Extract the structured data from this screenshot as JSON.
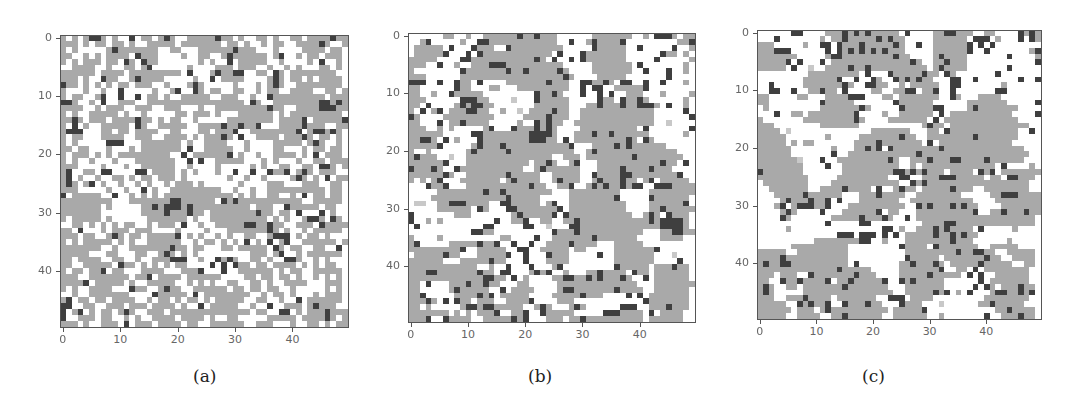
{
  "chart_data": [
    {
      "type": "heatmap",
      "title": "",
      "caption": "(a)",
      "xlabel": "",
      "ylabel": "",
      "grid_size": [
        50,
        50
      ],
      "xticks": [
        0,
        10,
        20,
        30,
        40
      ],
      "yticks": [
        0,
        10,
        20,
        30,
        40
      ],
      "xlim": [
        -0.5,
        49.5
      ],
      "ylim": [
        49.5,
        -0.5
      ],
      "legend": {
        "white": "empty",
        "gray": "state 1",
        "dark": "state 2"
      },
      "colors": {
        "white": "#ffffff",
        "gray": "#a9a9a9",
        "dark": "#3f3f3f",
        "light": "#c8c8c8"
      },
      "description": "Fine-grained mix; gray ~50%, dark scattered ~6%",
      "rows": [
        "g.g.gddg.g..d.gg.gdg..gggggdgg.g..gg.g..gg.ggggdgg",
        "ggg.g.gg.gg.g..ggggg.ggggggg.gg.g..g.gg..ggggdg..g",
        "g.g.....gdggggggg..gg...ggggggdggg...g....gggg.gg.",
        "gg..g.g.gggg.dggg....g..gg..gdgggggg.gd..g.gg.ggg.",
        "g.g.ggg.gg.dg.dgg.......g.g..d.ggggg..g....g.d..g.",
        "..gggg..g..gg.gd......g....ggg.ggg..g..g.g...gg.g.",
        "gggggg.gggg.ggggggggg.d...gdggdd..gg.dg.gggggggg..",
        "ggg.g..dgg..gdgggg.....g..d.gggg....gdg.gg.g.gggg.",
        "dgg.g.g.g.gg.ggg..g...gdg.....g...g.gdg..gggggggg.",
        "g...g..g..d.....g..gd..dg.gg..gg..g.gg..gggg..gg.g",
        "g.gg..gd..d..d.gg.g..ggggg..ggg..g..dggggggggg.ggg",
        "ddg..g.d..ggg..ggggggggggggggggg.dg..ggggggggddgdg",
        "gggg..g.ggg..ggg..ggg...g..gggggggggdgg..ggggdddgg",
        "g.g..ggggg.g..g.....gg.ggg.g...gggggg.g.ggggggggg.",
        "ggdg.ggg.ggggdgg.g.gg..g.....gggggggg.ggggd.gggggd",
        "g.d.g..ggggg.dg..ggggg..ggggdggdggd...ggggdggg..gg",
        "gddd...gg.gg.gggg..gg...gg.gggd..ggggggggd.gddgdg.",
        "g.gg...gggg..ggg..gggg.g.gggdg.d..gggg.gggdg.gg.g.",
        "g.g.....ddd...ggggggg.g..gggg...g....ggggg.gdg..g.",
        "gg.gg...g...g.ggggggg.d..ggggg..g....gg...g.gg.gg.",
        "g.ggg.g.g.ggggggggg..d.ggggggd.g..g..gggg.g.d.ggg.",
        "g.g..g...g...ggggggg..d.d..ggggg...g.g...g..gg.ggg",
        "ggg....g...g..gggggg..g....g.....g.g..gg..gg.ddg.g",
        "gd..gg.dd....dd.gggg.g.g...g..d..d..dggd.gdg.ggg..",
        "gd.g..g..gg.g.gg.ggg.g.......g..g..g....gdg.g.d.gg",
        "gdg.gd.g..g..g.g..g.ggg.g......g....ggg...ggg..gg.",
        "ggg.....g..g..d.g..ggggggggg..g..g..gggggggggg.gg.",
        "d.ggggg..d..g.g.g.gggggggggggg.g.g..gg..g.d.gg.gg.",
        "ggggggggg...gggggggddgggggg.dgdggggggggggg..ggggg.",
        "ggggggg.g.....ggdgdddgdgggggggggg.ggg..dggggg.gg..",
        "ggggggg.......ggggdgggdgg.ggggggggdgg.gg.d...d.g..",
        "g.ggggg.g......ggggggg.g..gggggggggg.g.g..gddg.dg.",
        "..gg.g.g.g.gg..g.ggg.d..g..gggggddggdgg..ggg.dgggg",
        "gg.d...g.ggg.ggg....g....g...gggggggdg.g..g.ggggg.",
        "ggg.gg..gdg.gg.gggggd.g.g..g.g..gg..gddd.g.gg.g...",
        "g.g.ggggg.g.g..gggggg..g.gg.g.g.d.g.d.gd..gggggg.g",
        "ggggggg..g..gggggggdgg.gg...gg.ggggg.dg.gg..gg..d.",
        "ggggg...gg...gg..gdg.g.g.........ggg.gd..g.gggggg.",
        "gg.gggg..gg..g..gggddd..g..dgdg..gg.g..ddg..g.g...",
        "gg..ggggg.dgg.g.g.g.gg....d.d.dgg.gg.gggg.g.g.gg..",
        "g.gg.ggd.gg...gggg...gggd...d..gggggg.g.gg..ggggg.",
        "ggg..ggggggg.ggd.gggg.gggggg....gg.gg.gg.g..g.g.g.",
        "ggggd.ggggg.g..ggggg..g.g.g..gg..gg.g..gggg...ggg.",
        "g.g..gggg...dgg..gdgg..gggggg.gg.gg.gg..g.....g.g.",
        "..g..ggggggg....dggggg.d.gggggggg..g.gg.g...g.ggg.",
        "gd.gg.gg.gggg..g.gg.g.gg.g.ggggg..gg..g..d.gggggg.",
        "dd..gg..ggg.ggg.gggg.g..d.ggggg..g..d..ggg.gdggg..",
        "d.gd.g.gg.gdg..ggg.gggggggggggggg.gg..dd.g.gggdggg",
        "d..ggg.gg..g.g..gggg.gggg.g..gg.....ggggg.ggggdg.g",
        "ggg.g..ggg.d.ggg.gggg.gg..gggggg..ggg...g..gg.g.gg"
      ]
    },
    {
      "type": "heatmap",
      "title": "",
      "caption": "(b)",
      "xlabel": "",
      "ylabel": "",
      "grid_size": [
        50,
        50
      ],
      "xticks": [
        0,
        10,
        20,
        30,
        40
      ],
      "yticks": [
        0,
        10,
        20,
        30,
        40
      ],
      "xlim": [
        -0.5,
        49.5
      ],
      "ylim": [
        49.5,
        -0.5
      ],
      "legend": {
        "white": "empty",
        "gray": "state 1",
        "dark": "state 2"
      },
      "colors": {
        "white": "#ffffff",
        "gray": "#a9a9a9",
        "dark": "#3f3f3f",
        "light": "#c8c8c8"
      },
      "description": "Larger coarsened gray clusters with dark cells mostly on cluster boundaries",
      "rows": [
        "......gg..g..ggggggdggdggg......ggggggg..g.dddg.gg",
        "..gd.....g..ddgggggggggggg..d..gdggggd.........ggd",
        ".ggggg.d...dggg..dggggggggg.....dggggg..d.....d..g",
        ".gggggd...d.dgggggggggggg.d...dggggggg......dgg.g.",
        "ggggg....ddgggggggggggdg.d..d.dggggggg.....d.....g",
        "ggg..d..g..gggdddgggggggggg.....ggggggg.d.......g.",
        "g........dgggggggdggdgggggdg....ggggggg..d...d..g.",
        "ggg......ggggggggggggggggggdg....ggggg.......d....",
        "ddd..d..dgg.d....gggggggdggg..ddggdg.dd..d..d...g.",
        "gg......dgg...gg...ggggggggg..d.dd..gggggd.......",
        "gg..g..dggggg.........dggdg...d..d.d..ggg...g....g",
        "ggg......dddgg....l...dggggg.....dgg.dggdg......g.",
        "gg.d....gdgddgg.......gggggg...ggdgggdggdddg.d..g.",
        "g.d.gd.gggddgg..g..l.ggggdgg..ggggggggggggg.....d",
        "dg....ggggggggg.....ggggdggg..ggggggggggggg......d",
        "gg...d.ggdgggg.....g..dgdgg..gggggggggggggg..l...",
        "ggg..g.g.....gd...dgggdgdg....gggggggggg.d.......d",
        "gggggg.....ddggggggggddddg...gggdggdgggggg......g",
        "ggddg.d.g...dggggggggdddgg.d.gggggggggdg.dg.......",
        "gggggd.....gdgggdgggggggggggd...ggggdgdgggggg.....",
        "g..g......gdgggggdggggggggggg..gdgggggggggggggg..",
        "gdggg..l..ggggggggggggggg..ggg.ggggggggdgggggggg..",
        "ggggggd...ggggggggggg.ggdg..gd...gggggggggggdgg.d.",
        "dgggdg..dggggggggggg..gdgggggg...ggggdggggdggg....",
        "ggggggdg..gggggggdggggg..ggggg..dggggddggggggggd..",
        "g.g.gd...ggggggg.gdgggg..gdggg..gdgggdgg.gd.ggggg",
        "...dggd...gggggggggggdgg..ggd..gdgdggdgdd..dddggggd",
        ".....ggggggggdggdgggggggg...ggggggggg.....gggggggg",
        "....gggggggggggggdggggg.....ggggggggd.....dgggggg",
        ".ll..ggdddgggg..ddggggg.gd..gggggggggg....ggggggd",
        ".....gggggg.dg...ddgggggggd.gggggggggg....ggdggggg",
        "d.......ggg.......gdgggggd.dggggggggggg..gdg.dggg",
        "d..g.g.........d..ggd..gg..ggdggggggggggggdgddddg",
        ".d...........dd.....dd..l...ddggggggggggggggddddg",
        "...........ddgg..........dgggdggggggggggg...ggddgg",
        "g....g..........gg....d..gggggggdggggggg....gggg.",
        "gd.....gggggdggd..d..d..ggggdgggg...ggggg........",
        "gggggggggd..ggggg..dd..ggggg.gg.....gggggggd.....",
        ".gggggdgg...gggggd..d...dggg.....d..ggggggg...l.",
        "gggggg...gggggdgg...d...gggg........ggggggg....d.",
        "gggggggggggg..g..d...d...gd.........dggggg.gggdgg",
        "gggddgggggggdgg.dd...gdgd..g...ggdgggg.dgg.gggggg",
        "gggggggggggggddgg.d.g....ggddggdgdgggdg..d.gggggg",
        "gg.d...gggdggdgg...gg.....gggggggggggggg...ggggggg",
        "gg.....gdggggg..d.gggg....gddgggggggdgggg..gggggg",
        "ggd.....ggggdgd.ggggg....gggggdggg....d.d.ggggggg",
        "gggdg.d.dgg.ggg..ggggd....ggg............dggggggg",
        "gg.g.....gddgddggggg..gdg...gdg......ddd..gggdggg",
        "ggggggg.g.g.gggd..ggd..dggggg.....dddgggg.d.gggg.",
        "gggd..dgggg..gggggdgd...ggg.ggdgggggggggg.gggggg."
      ]
    },
    {
      "type": "heatmap",
      "title": "",
      "caption": "(c)",
      "xlabel": "",
      "ylabel": "",
      "grid_size": [
        50,
        50
      ],
      "xticks": [
        0,
        10,
        20,
        30,
        40
      ],
      "yticks": [
        0,
        10,
        20,
        30,
        40
      ],
      "xlim": [
        -0.5,
        49.5
      ],
      "ylim": [
        49.5,
        -0.5
      ],
      "legend": {
        "white": "empty",
        "gray": "state 1",
        "dark": "state 2"
      },
      "colors": {
        "white": "#ffffff",
        "gray": "#a9a9a9",
        "dark": "#3f3f3f",
        "light": "#c8c8c8"
      },
      "description": "Large gray clusters, more dark cells than (b)",
      "rows": [
        "......dd....gggdgdgdggggg.d....ggddggg..gg....dgdg",
        "...d.......g.ggdgggggdgdgg.....gggggg.ddd.g...d.dg",
        "ggg.....g..dd.dgggdgggggdg..d..ggggggd.d.d.......",
        "gggddd......d.dgdgdgdgdggg.....ggggggd..d.......gd",
        "ggggggg.....gddgggggggggdgg....gdgggg.......d....g",
        "gggggd.d...d.ggggggggggggggdg..ggdggg............d",
        "ggggg.d..l..ggggdggdgggggggggg.gdgggg.......d.....",
        ".........ggggggggg.d...dgggggdgg.dg.......d.......",
        "........ggggggd..d..dg..dgdgdgg...dd..d.......d..d",
        "..d.....gggggggdg..ddgg..g.ggggg..dd.......g.....",
        "..dd..d..ggdgg.d....gg..ggdd.ggd..d.......dd.....",
        "gg.....gg...ggggddd...gg.ggggggg..dg...gggg.......",
        "gg.........dggggg.......dgggggg......ggggggg.....dd",
        ".g.........gggggggdg.....dgggggdd....gdggggggg...",
        "...d..gg.ggggggggd....g..gggggg.d.ggggggggggg....d",
        "g.......gggggggggdg....ggggggg.d.ggggggggggggg...",
        "ggg........ggggggg...........gdgg.gggggggggggggg..",
        "gggg.l..............ggggggg...gg.dgggggggggggg..d.",
        "ggggg.......g.....gggggggdgg..ggggggggdggggggg....",
        "ggggg.g.gg.......ggggdggggggg.d.ggggggggggggg.....",
        "gggggg.......g...ggdgd.dggggggggdgggggggggggggg...",
        "gggggg.......d..ggggggggggggdggggggggggggggggggg..",
        "gggggggl...d..gggggggggdg..gggdgggddggggdgggggg...",
        "gggggggg....d..gggggggggg..g.ggggggggggggg.d....g",
        "dggggggg.......gggggggggddgdgdggg.gggg.dgd.gggggggg",
        "ggggggggg.....ggggggggg..dd..gggdddggggg.gg.ddggg",
        ".gggggggg....gggggggggggg..dgdgggggggggggggggggg",
        "..ggggggg..ggggdgggg.d..gdgg.gggggdggg..gggggggg",
        "...gggggdgggggg...gggdgggg..gggggggg.....ggdddgggg",
        "....gdgggdggd.d...ggggggg..ggggggggggg....gggggggg",
        "...gd.gdddggd...gggggggggg..dgdgggdgdgg....ggggggg",
        "....gdg....d...ggggggd.gg...ggggggggggd..ggdgggdgg",
        "....dg.......gggggdgggdg..d.ggggggggggggggggggggg",
        "............d.....dd.........ggggddgggggggggggggg",
        ".....g................dd.g..gggdgdgggg.d.....g..",
        "..............ddd.ddd.d.d.gggggdggdgdgg..........",
        "..........ggggggggdd..g...ggggggggdggg......g....",
        "......gggggggggg.........dgggg.dggggggg..ggggg..",
        "ggggg..ggggggggg..........gggggggggdggddgg..ggggg",
        "ggggdggggggggggg..........dggggg.gggggggdgg..gggg",
        "gdggddgggggggggg.d.......ggdgggdg.gggggdggggg..gg",
        "ggggggggggggggdggggg.....gggggggd..gg.d.gggggggg",
        "ggg.ggg..dgggggggdggg....gggggdggggg.d.d..gggggg",
        "gg..dggdggggd.ggdgggggd..dgdggggg......d.ggggggg",
        "gdg..gg.gggggggdggggggg...ggggggg.....d.dg.gggdgg",
        "gdg.....gggggggggggggggg..gggggdgd.g.d...gddggdgd",
        "ggg..gggdgggg.ggggggg..ddd.gggg.........gggggggg",
        "ggggg..dgdggd..dgggdgg...dggg...l......ggdggggg",
        "gggggg.ggg.gdgggggggggg.gggggd............ggdgggg",
        "ggggg..gggg..ggdgggggg..gggggg..g.......d..gggdgg"
      ]
    }
  ],
  "figure": {
    "captions": [
      "(a)",
      "(b)",
      "(c)"
    ],
    "tick_labels": [
      "0",
      "10",
      "20",
      "30",
      "40"
    ]
  }
}
